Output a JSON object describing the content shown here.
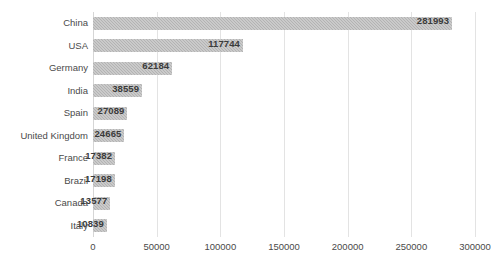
{
  "chart_data": {
    "type": "bar",
    "orientation": "horizontal",
    "title": "",
    "subtitle": "",
    "xlabel": "",
    "ylabel": "",
    "categories": [
      "China",
      "USA",
      "Germany",
      "India",
      "Spain",
      "United Kingdom",
      "France",
      "Brazil",
      "Canada",
      "Italy"
    ],
    "values": [
      281993,
      117744,
      62184,
      38559,
      27089,
      24665,
      17382,
      17198,
      13577,
      10839
    ],
    "value_labels": [
      "281993",
      "117744",
      "62184",
      "38559",
      "27089",
      "24665",
      "17382",
      "17198",
      "13577",
      "10839"
    ],
    "xlim": [
      0,
      300000
    ],
    "xticks": [
      0,
      50000,
      100000,
      150000,
      200000,
      250000,
      300000
    ],
    "xtick_labels": [
      "0",
      "50000",
      "100000",
      "150000",
      "200000",
      "250000",
      "300000"
    ],
    "grid": true,
    "grid_axis": "x",
    "legend": false,
    "legend_position": "none",
    "data_labels": true,
    "data_label_position": "inside-end",
    "series": [
      {
        "name": "",
        "values": [
          281993,
          117744,
          62184,
          38559,
          27089,
          24665,
          17382,
          17198,
          13577,
          10839
        ]
      }
    ],
    "colors": {
      "bar": "#b3b3b3",
      "grid": "#e3e3e3",
      "axis": "#d6d6d6",
      "text": "#4a4a4a",
      "label_text": "#3b3b3b",
      "background": "#ffffff"
    }
  }
}
